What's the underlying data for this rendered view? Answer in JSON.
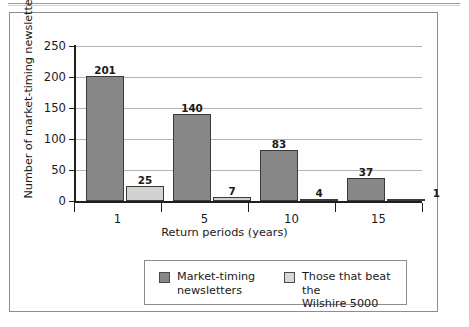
{
  "figure": {
    "y_axis_title": "Number of market-timing newsletters",
    "x_axis_title": "Return periods (years)"
  },
  "legend": {
    "entries": [
      {
        "label": "Market-timing\nnewsletters",
        "color": "#878787",
        "swatch": "primary"
      },
      {
        "label": "Those that beat the\nWilshire 5000",
        "color": "#d8d8d8",
        "swatch": "secondary"
      }
    ]
  },
  "chart_data": {
    "type": "bar",
    "title": "",
    "xlabel": "Return periods (years)",
    "ylabel": "Number of market-timing newsletters",
    "categories": [
      "1",
      "5",
      "10",
      "15"
    ],
    "series": [
      {
        "name": "Market-timing newsletters",
        "color": "#878787",
        "values": [
          201,
          140,
          83,
          37
        ]
      },
      {
        "name": "Those that beat the Wilshire 5000",
        "color": "#d2d2d2",
        "values": [
          25,
          7,
          4,
          1
        ]
      }
    ],
    "ylim": [
      0,
      250
    ],
    "yticks": [
      0,
      50,
      100,
      150,
      200,
      250
    ],
    "ytick_labels": [
      "0",
      "50",
      "100",
      "150",
      "200",
      "250"
    ],
    "grid": true,
    "grid_axis": "y",
    "legend_position": "bottom",
    "data_labels": true
  }
}
